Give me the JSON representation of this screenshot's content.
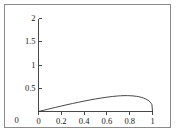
{
  "figure": {
    "border_color": "#8a8a8a",
    "background": "#ffffff"
  },
  "chart_data": {
    "type": "line",
    "title": "",
    "subtitle": "",
    "xlabel": "",
    "ylabel": "",
    "xlim": [
      0,
      1
    ],
    "ylim": [
      0,
      2
    ],
    "grid": false,
    "legend": null,
    "legend_position": "none",
    "axis_color": "#1a1a1a",
    "line_color": "#333333",
    "line_width": 0.9,
    "xticks": [
      0,
      0.2,
      0.4,
      0.6,
      0.8,
      1
    ],
    "xtick_labels": [
      "0",
      "0.2",
      "0.4",
      "0.6",
      "0.8",
      "1"
    ],
    "yticks": [
      0,
      0.5,
      1,
      1.5,
      2
    ],
    "ytick_labels": [
      "0",
      "0.5",
      "1",
      "1.5",
      "2"
    ],
    "series": [
      {
        "name": "curve",
        "x": [
          0,
          0.02,
          0.05,
          0.08,
          0.1,
          0.15,
          0.2,
          0.25,
          0.3,
          0.35,
          0.4,
          0.45,
          0.5,
          0.55,
          0.6,
          0.65,
          0.7,
          0.72,
          0.75,
          0.78,
          0.8,
          0.83,
          0.86,
          0.88,
          0.9,
          0.92,
          0.94,
          0.96,
          0.97,
          0.98,
          0.99,
          0.995,
          1
        ],
        "y": [
          0,
          0.012,
          0.03,
          0.048,
          0.06,
          0.089,
          0.118,
          0.146,
          0.173,
          0.199,
          0.224,
          0.248,
          0.27,
          0.29,
          0.308,
          0.323,
          0.335,
          0.338,
          0.341,
          0.341,
          0.34,
          0.335,
          0.326,
          0.318,
          0.306,
          0.291,
          0.271,
          0.243,
          0.225,
          0.201,
          0.17,
          0.145,
          0
        ]
      }
    ],
    "annotations": []
  }
}
